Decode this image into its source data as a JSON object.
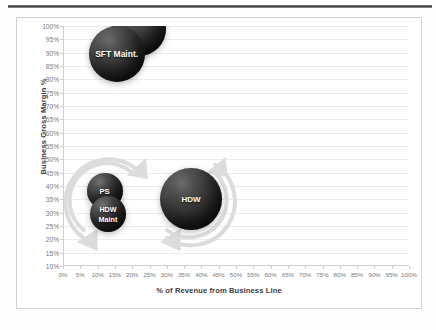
{
  "chart_data": {
    "type": "scatter",
    "title": "",
    "subtitle": "",
    "xlabel": "% of Revenue from Business Line",
    "ylabel": "Business Gross Margin %",
    "xlim": [
      0,
      100
    ],
    "ylim": [
      10,
      100
    ],
    "grid": "horizontal-only",
    "legend": "none",
    "x_ticks": [
      "0%",
      "5%",
      "10%",
      "15%",
      "20%",
      "25%",
      "30%",
      "35%",
      "40%",
      "45%",
      "50%",
      "55%",
      "60%",
      "65%",
      "70%",
      "75%",
      "80%",
      "85%",
      "90%",
      "95%",
      "100%"
    ],
    "x_tick_values": [
      0,
      5,
      10,
      15,
      20,
      25,
      30,
      35,
      40,
      45,
      50,
      55,
      60,
      65,
      70,
      75,
      80,
      85,
      90,
      95,
      100
    ],
    "y_ticks": [
      "100%",
      "95%",
      "90%",
      "85%",
      "80%",
      "75%",
      "70%",
      "65%",
      "60%",
      "55%",
      "50%",
      "45%",
      "40%",
      "35%",
      "30%",
      "25%",
      "20%",
      "15%",
      "10%"
    ],
    "y_tick_values": [
      100,
      95,
      90,
      85,
      80,
      75,
      70,
      65,
      60,
      55,
      50,
      45,
      40,
      35,
      30,
      25,
      20,
      15,
      10
    ],
    "bubbles": [
      {
        "label": "SFT",
        "x": 22.0,
        "y": 99.0,
        "size": 27,
        "label_dy": -8,
        "font": 8.0,
        "color": "#1f1f1f"
      },
      {
        "label": "SFT Maint.",
        "x": 15.5,
        "y": 89.5,
        "size": 28,
        "label_dy": 0,
        "font": 8.5,
        "color": "#1f1f1f"
      },
      {
        "label": "PS",
        "x": 12.0,
        "y": 38.0,
        "size": 18,
        "label_dy": 0,
        "font": 7.6,
        "color": "#1f1f1f"
      },
      {
        "label": "HDW",
        "x": 13.0,
        "y": 29.5,
        "size": 18,
        "label_dy": -5,
        "font": 7.2,
        "color": "#1f1f1f"
      },
      {
        "label": "Maint",
        "x": 13.0,
        "y": 29.5,
        "size": 0,
        "label_dy": 5,
        "font": 7.2,
        "color": "#1f1f1f"
      },
      {
        "label": "HDW",
        "x": 37.0,
        "y": 35.0,
        "size": 31,
        "label_dy": 0,
        "font": 8.0,
        "color": "#1f1f1f"
      }
    ],
    "annotations": [
      {
        "name": "growth-arrow-left",
        "type": "circular-arrow",
        "color": "#dcdcdc"
      },
      {
        "name": "growth-arrow-right",
        "type": "circular-arrow",
        "color": "#dcdcdc"
      }
    ]
  },
  "colors": {
    "bubble_fill": "#1f1f1f",
    "bubble_label": "#ffffff",
    "gridline": "#ececec",
    "axis": "#cfcfcf",
    "tick_text": "#7b7b7b",
    "axis_title": "#3d3d3d",
    "frame_border": "#d2d2d2",
    "annotation": "#dcdcdc",
    "page_background": "#ffffff"
  }
}
